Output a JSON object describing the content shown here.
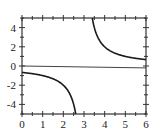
{
  "chart_data": {
    "type": "line",
    "title": "",
    "xlabel": "",
    "ylabel": "",
    "xlim": [
      0,
      6
    ],
    "ylim": [
      -5,
      5
    ],
    "grid": false,
    "legend": null,
    "x_ticks": [
      0,
      1,
      2,
      3,
      4,
      5,
      6
    ],
    "y_ticks": [
      -4,
      -2,
      0,
      2,
      4
    ],
    "x_tick_labels": [
      "0",
      "1",
      "2",
      "3",
      "4",
      "5",
      "6"
    ],
    "y_tick_labels": [
      "-4",
      "-2",
      "0",
      "2",
      "4"
    ],
    "series": [
      {
        "name": "left branch",
        "x": [
          0,
          0.5,
          1,
          1.5,
          2,
          2.25,
          2.5,
          2.6
        ],
        "y": [
          -0.67,
          -0.8,
          -1.0,
          -1.33,
          -2.0,
          -2.67,
          -4.0,
          -5.0
        ]
      },
      {
        "name": "right branch",
        "x": [
          3.4,
          3.5,
          3.75,
          4,
          4.5,
          5,
          5.5,
          6
        ],
        "y": [
          5.0,
          4.0,
          2.67,
          2.0,
          1.33,
          1.0,
          0.8,
          0.67
        ]
      },
      {
        "name": "zero line",
        "x": [
          0,
          6
        ],
        "y": [
          0,
          -0.2
        ]
      }
    ],
    "annotations": []
  },
  "colors": {
    "curve": "#1a1a1a",
    "axis": "#333333",
    "zero_line": "#444444",
    "background": "#ffffff"
  }
}
